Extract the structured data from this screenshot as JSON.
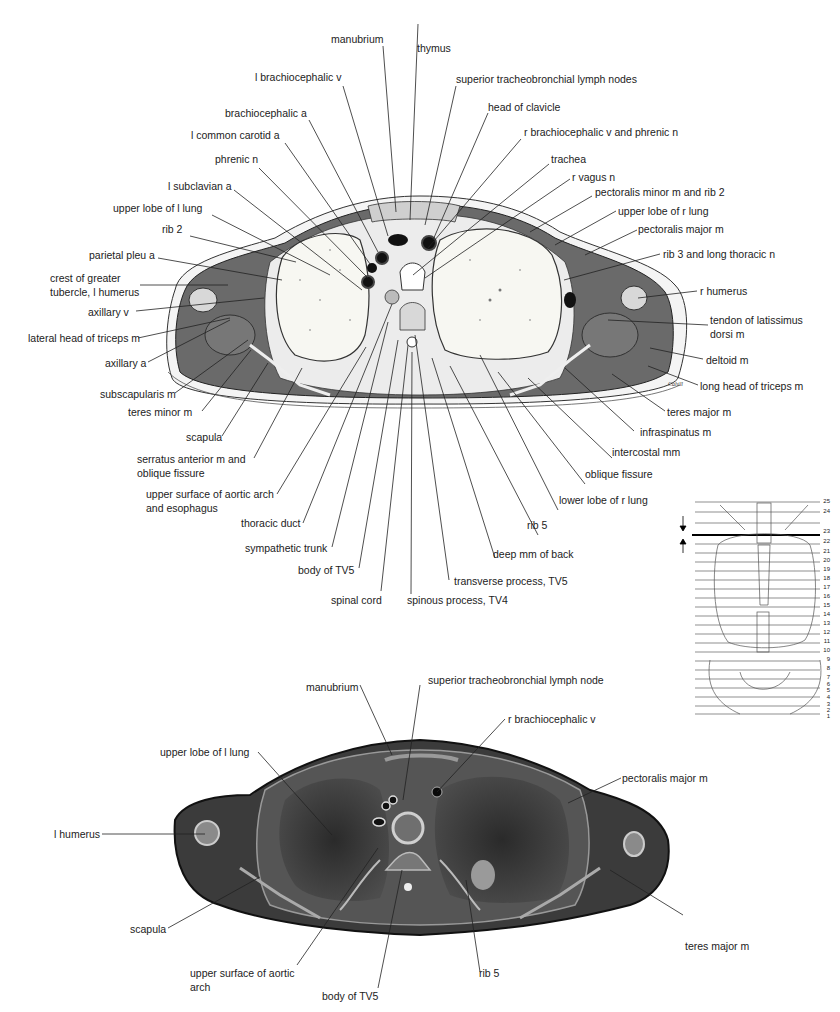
{
  "figure": {
    "top_panel": "drawing of transverse section of thorax",
    "bottom_panel": "photograph of transverse section of thorax",
    "signature": "Cahill"
  },
  "top_labels": {
    "manubrium": "manubrium",
    "thymus": "thymus",
    "l_brachiocephalic_v": "l brachiocephalic v",
    "superior_tracheobronchial_lymph_nodes": "superior tracheobronchial lymph nodes",
    "brachiocephalic_a": "brachiocephalic a",
    "head_of_clavicle": "head of clavicle",
    "l_common_carotid_a": "l common carotid a",
    "r_brachiocephalic_v_and_phrenic_n": "r brachiocephalic v and phrenic n",
    "phrenic_n": "phrenic n",
    "trachea": "trachea",
    "l_subclavian_a": "l subclavian a",
    "r_vagus_n": "r vagus n",
    "upper_lobe_of_l_lung": "upper lobe of l lung",
    "pectoralis_minor_m_and_rib_2": "pectoralis minor m and rib 2",
    "upper_lobe_of_r_lung": "upper lobe of r lung",
    "rib_2": "rib 2",
    "pectoralis_major_m": "pectoralis major m",
    "parietal_pleura": "parietal pleu a",
    "rib_3_and_long_thoracic_n": "rib 3 and long thoracic n",
    "crest_of_greater_tubercle_1": "crest of greater",
    "crest_of_greater_tubercle_2": "tubercle, l humerus",
    "r_humerus": "r humerus",
    "axillary_v": "axillary v",
    "lateral_head_of_triceps_m": "lateral head of triceps m",
    "tendon_of_latissimus_1": "tendon of latissimus",
    "tendon_of_latissimus_2": "dorsi m",
    "axillary_a": "axillary a",
    "deltoid_m": "deltoid m",
    "subscapularis_m": "subscapularis m",
    "long_head_of_triceps_m": "long head of triceps m",
    "teres_minor_m": "teres minor m",
    "teres_major_m": "teres major m",
    "scapula": "scapula",
    "infraspinatus_m": "infraspinatus m",
    "serratus_anterior_1": "serratus anterior m and",
    "serratus_anterior_2": "oblique fissure",
    "intercostal_mm": "intercostal mm",
    "oblique_fissure": "oblique fissure",
    "aortic_arch_1": "upper surface of aortic arch",
    "aortic_arch_2": "and esophagus",
    "lower_lobe_of_r_lung": "lower lobe of r lung",
    "thoracic_duct": "thoracic duct",
    "rib_5": "rib 5",
    "sympathetic_trunk": "sympathetic trunk",
    "deep_mm_of_back": "deep mm of back",
    "body_of_tv5": "body of TV5",
    "transverse_process_tv5": "transverse process, TV5",
    "spinal_cord": "spinal cord",
    "spinous_process_tv4": "spinous process, TV4"
  },
  "bottom_labels": {
    "manubrium": "manubrium",
    "superior_tracheobronchial_lymph_node": "superior tracheobronchial lymph node",
    "r_brachiocephalic_v": "r brachiocephalic v",
    "upper_lobe_of_l_lung": "upper lobe of l lung",
    "pectoralis_major_m": "pectoralis major m",
    "l_humerus": "l humerus",
    "scapula": "scapula",
    "teres_major_m": "teres major m",
    "aortic_arch_1": "upper surface of aortic",
    "aortic_arch_2": "arch",
    "body_of_tv5": "body of TV5",
    "rib_5": "rib 5"
  },
  "level_indicator": {
    "selected_level": "23",
    "levels": [
      "25",
      "24",
      "23",
      "22",
      "21",
      "20",
      "19",
      "18",
      "17",
      "16",
      "15",
      "14",
      "13",
      "12",
      "11",
      "10",
      "9",
      "8",
      "7",
      "6",
      "5",
      "4",
      "3",
      "2",
      "1"
    ]
  }
}
